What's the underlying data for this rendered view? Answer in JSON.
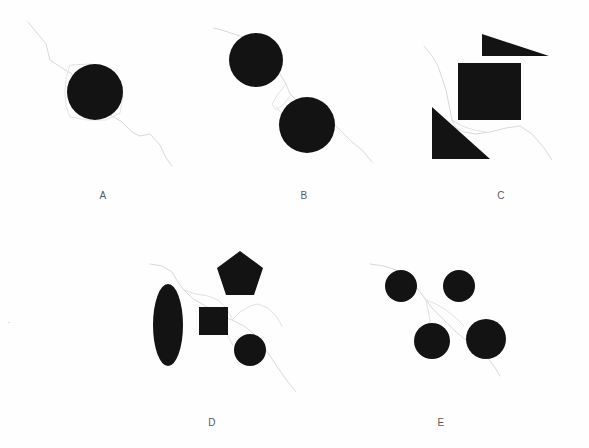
{
  "figure": {
    "title": "",
    "background_color": "#ffffff",
    "shape_color": "#131313",
    "line_color": "#d9d9d9",
    "label_color": "#59595b",
    "width": 589,
    "height": 448
  },
  "panels": [
    {
      "id": "A",
      "label": "A",
      "label_x": 103,
      "label_y": 190,
      "shape_count": 1,
      "shapes": [
        {
          "name": "circle",
          "cx": 95,
          "cy": 92,
          "r": 28
        }
      ]
    },
    {
      "id": "B",
      "label": "B",
      "label_x": 304,
      "label_y": 190,
      "shape_count": 2,
      "shapes": [
        {
          "name": "circle",
          "cx": 256,
          "cy": 60,
          "r": 27
        },
        {
          "name": "circle",
          "cx": 307,
          "cy": 125,
          "r": 28
        }
      ]
    },
    {
      "id": "C",
      "label": "C",
      "label_x": 501,
      "label_y": 190,
      "shape_count": 3,
      "shapes": [
        {
          "name": "triangle",
          "points": "482,34 482,56 549,56"
        },
        {
          "name": "square",
          "x": 458,
          "y": 63,
          "w": 63,
          "h": 57
        },
        {
          "name": "triangle",
          "points": "432,107 432,159 490,159"
        }
      ]
    },
    {
      "id": "D",
      "label": "D",
      "label_x": 212,
      "label_y": 417,
      "shape_count": 4,
      "shapes": [
        {
          "name": "ellipse",
          "cx": 168,
          "cy": 325,
          "rx": 15,
          "ry": 41
        },
        {
          "name": "pentagon",
          "cx": 240,
          "cy": 274,
          "r": 24
        },
        {
          "name": "square",
          "x": 199,
          "y": 307,
          "w": 29,
          "h": 28
        },
        {
          "name": "circle",
          "cx": 250,
          "cy": 350,
          "r": 16
        }
      ]
    },
    {
      "id": "E",
      "label": "E",
      "label_x": 441,
      "label_y": 417,
      "shape_count": 4,
      "shapes": [
        {
          "name": "circle",
          "cx": 401,
          "cy": 286,
          "r": 16
        },
        {
          "name": "circle",
          "cx": 459,
          "cy": 286,
          "r": 16
        },
        {
          "name": "circle",
          "cx": 432,
          "cy": 341,
          "r": 18
        },
        {
          "name": "circle",
          "cx": 486,
          "cy": 339,
          "r": 20
        }
      ]
    }
  ]
}
